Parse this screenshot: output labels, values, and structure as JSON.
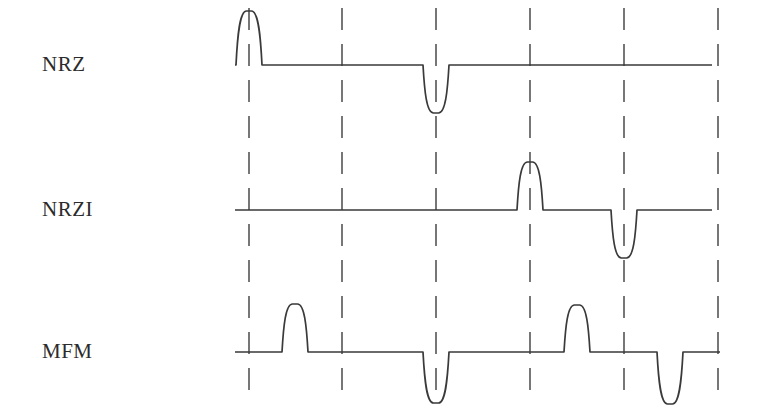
{
  "figure": {
    "title": "",
    "background_color": "#ffffff",
    "line_color": "#3a3a3a",
    "grid_color": "#555555",
    "width": 757,
    "height": 418
  },
  "rows": [
    {
      "id": "nrz",
      "label": "NRZ",
      "label_x": 42,
      "label_y": 52,
      "baseline_y": 65
    },
    {
      "id": "nrzi",
      "label": "NRZI",
      "label_x": 42,
      "label_y": 197,
      "baseline_y": 210
    },
    {
      "id": "mfm",
      "label": "MFM",
      "label_x": 42,
      "label_y": 339,
      "baseline_y": 352
    }
  ],
  "chart_data": {
    "type": "line",
    "title": "",
    "xlabel": "",
    "ylabel": "",
    "grid": true,
    "legend_position": "left",
    "x_gridlines": [
      249,
      342,
      436,
      530,
      624,
      718
    ],
    "gridline_top": 8,
    "gridline_bottom": 402,
    "grid_dash": "22 14",
    "cell_width": 93.8,
    "series": [
      {
        "name": "NRZ",
        "baseline_y": 65,
        "x_start": 235,
        "x_end": 712,
        "pulses": [
          {
            "center_x": 249,
            "direction": "up",
            "peak_y": 11,
            "half_width": 13
          },
          {
            "center_x": 436,
            "direction": "down",
            "peak_y": 113,
            "half_width": 13
          }
        ]
      },
      {
        "name": "NRZI",
        "baseline_y": 210,
        "x_start": 235,
        "x_end": 712,
        "pulses": [
          {
            "center_x": 530,
            "direction": "up",
            "peak_y": 162,
            "half_width": 13
          },
          {
            "center_x": 624,
            "direction": "down",
            "peak_y": 258,
            "half_width": 13
          }
        ]
      },
      {
        "name": "MFM",
        "baseline_y": 352,
        "x_start": 235,
        "x_end": 720,
        "pulses": [
          {
            "center_x": 295,
            "direction": "up",
            "peak_y": 304,
            "half_width": 13
          },
          {
            "center_x": 436,
            "direction": "down",
            "peak_y": 403,
            "half_width": 13
          },
          {
            "center_x": 577,
            "direction": "up",
            "peak_y": 305,
            "half_width": 13
          },
          {
            "center_x": 670,
            "direction": "down",
            "peak_y": 404,
            "half_width": 13
          }
        ]
      }
    ]
  }
}
